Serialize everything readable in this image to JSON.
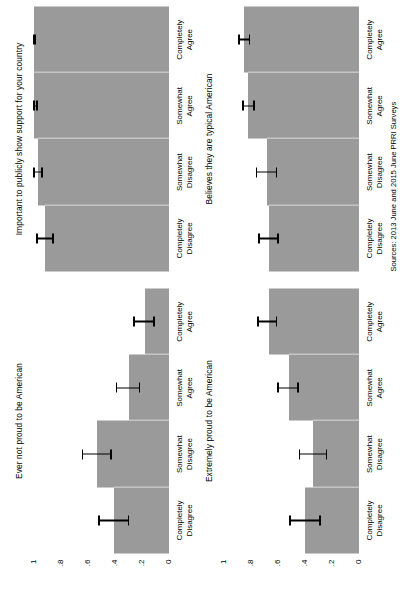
{
  "figure": {
    "source_note": "Sources: 2013 June and 2015 June PRRI Surveys",
    "bar_color": "#9a9a9a",
    "error_bar_color": "#000000",
    "background": "#ffffff"
  },
  "axis": {
    "tick_labels": [
      "0",
      ".2",
      ".4",
      ".6",
      ".8",
      "1"
    ],
    "tick_values": [
      0,
      0.2,
      0.4,
      0.6,
      0.8,
      1
    ],
    "ylim": [
      0,
      1
    ]
  },
  "categories": [
    {
      "line1": "Completely",
      "line2": "Disagree"
    },
    {
      "line1": "Somewhat",
      "line2": "Disagree"
    },
    {
      "line1": "Somewhat",
      "line2": "Agree"
    },
    {
      "line1": "Completely",
      "line2": "Agree"
    }
  ],
  "chart_data": {
    "type": "bar",
    "title": "",
    "xlabel": "",
    "ylabel": "",
    "ylim": [
      0,
      1
    ],
    "grid": false,
    "legend": null,
    "orientation": "horizontal-rotated",
    "categories": [
      "Completely Disagree",
      "Somewhat Disagree",
      "Somewhat Agree",
      "Completely Agree"
    ],
    "panels": [
      {
        "id": "panel-extremely-proud",
        "title": "Extremely proud to be American",
        "position": "bottom-left",
        "values": [
          0.4,
          0.34,
          0.52,
          0.67
        ],
        "ci_low": [
          0.29,
          0.24,
          0.45,
          0.61
        ],
        "ci_high": [
          0.51,
          0.44,
          0.6,
          0.75
        ]
      },
      {
        "id": "panel-ever-not-proud",
        "title": "Ever not proud to be American",
        "position": "top-left",
        "values": [
          0.41,
          0.53,
          0.3,
          0.18
        ],
        "ci_low": [
          0.3,
          0.43,
          0.22,
          0.11
        ],
        "ci_high": [
          0.52,
          0.64,
          0.39,
          0.26
        ]
      },
      {
        "id": "panel-believes-typical",
        "title": "Believes they are typical American",
        "position": "bottom-right",
        "values": [
          0.67,
          0.68,
          0.82,
          0.85
        ],
        "ci_low": [
          0.6,
          0.61,
          0.78,
          0.81
        ],
        "ci_high": [
          0.74,
          0.76,
          0.86,
          0.89
        ]
      },
      {
        "id": "panel-show-support",
        "title": "Important to publicly show support for your country",
        "position": "top-right",
        "values": [
          0.92,
          0.97,
          1.0,
          1.0
        ],
        "ci_low": [
          0.86,
          0.94,
          0.98,
          0.99
        ],
        "ci_high": [
          0.98,
          1.0,
          1.0,
          1.0
        ]
      }
    ]
  }
}
